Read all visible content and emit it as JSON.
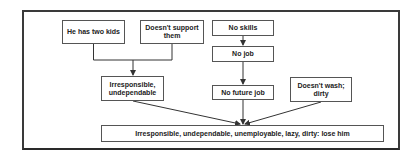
{
  "diagram": {
    "type": "flowchart",
    "nodes": {
      "kids": {
        "label": "He has two kids"
      },
      "support": {
        "label": "Doesn't support them"
      },
      "irresponsible": {
        "label": "Irresponsible, undependable"
      },
      "no_skills": {
        "label": "No skills"
      },
      "no_job": {
        "label": "No job"
      },
      "no_future_job": {
        "label": "No future job"
      },
      "dirty": {
        "label": "Doesn't wash; dirty"
      },
      "conclusion": {
        "label": "Irresponsible, undependable, unemployable, lazy, dirty: lose him"
      }
    },
    "edges": [
      {
        "from": [
          "kids",
          "support"
        ],
        "to": "irresponsible"
      },
      {
        "from": "no_skills",
        "to": "no_job"
      },
      {
        "from": "no_job",
        "to": "no_future_job"
      },
      {
        "from": "irresponsible",
        "to": "conclusion"
      },
      {
        "from": "no_future_job",
        "to": "conclusion"
      },
      {
        "from": "dirty",
        "to": "conclusion"
      }
    ],
    "colors": {
      "line": "#333333",
      "box_border": "#555555",
      "text": "#222222"
    }
  }
}
